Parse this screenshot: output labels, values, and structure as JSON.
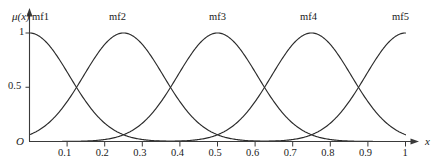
{
  "chart_data": {
    "type": "line",
    "title": "",
    "xlabel": "x",
    "ylabel": "μ(x)",
    "xlim": [
      0,
      1
    ],
    "ylim": [
      0,
      1
    ],
    "grid": false,
    "legend_position": "inline-above-peaks",
    "x_ticks": [
      "0.1",
      "0.2",
      "0.3",
      "0.4",
      "0.5",
      "0.6",
      "0.7",
      "0.8",
      "0.9",
      "1"
    ],
    "x_tick_values": [
      0.1,
      0.2,
      0.3,
      0.4,
      0.5,
      0.6,
      0.7,
      0.8,
      0.9,
      1.0
    ],
    "y_ticks": [
      "1",
      "0.5"
    ],
    "y_tick_values": [
      1.0,
      0.5
    ],
    "origin_label": "O",
    "series": [
      {
        "name": "mf1",
        "type": "gaussmf",
        "center": 0.0,
        "sigma": 0.106,
        "peak_value": 1.0,
        "label_x": 0.03,
        "label_y": 1.0
      },
      {
        "name": "mf2",
        "type": "gaussmf",
        "center": 0.25,
        "sigma": 0.106,
        "peak_value": 1.0,
        "label_x": 0.25,
        "label_y": 1.0
      },
      {
        "name": "mf3",
        "type": "gaussmf",
        "center": 0.5,
        "sigma": 0.106,
        "peak_value": 1.0,
        "label_x": 0.5,
        "label_y": 1.0
      },
      {
        "name": "mf4",
        "type": "gaussmf",
        "center": 0.75,
        "sigma": 0.106,
        "peak_value": 1.0,
        "label_x": 0.75,
        "label_y": 1.0
      },
      {
        "name": "mf5",
        "type": "gaussmf",
        "center": 1.0,
        "sigma": 0.106,
        "peak_value": 1.0,
        "label_x": 0.97,
        "label_y": 1.0
      }
    ],
    "curve_colors": {
      "stroke": "#2b2b2b",
      "axis": "#3a3a3a"
    }
  },
  "labels": {
    "y_axis_name": "μ(x)",
    "x_axis_name": "x",
    "origin": "O",
    "y_tick_1": "1",
    "y_tick_05": "0.5",
    "mf1": "mf1",
    "mf2": "mf2",
    "mf3": "mf3",
    "mf4": "mf4",
    "mf5": "mf5",
    "x_tick_01": "0.1",
    "x_tick_02": "0.2",
    "x_tick_03": "0.3",
    "x_tick_04": "0.4",
    "x_tick_05": "0.5",
    "x_tick_06": "0.6",
    "x_tick_07": "0.7",
    "x_tick_08": "0.8",
    "x_tick_09": "0.9",
    "x_tick_1": "1"
  }
}
